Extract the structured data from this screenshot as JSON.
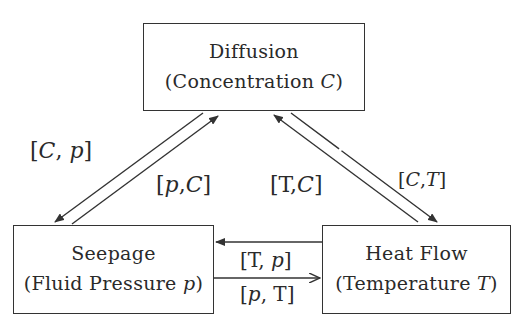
{
  "nodes": {
    "diffusion": {
      "title": "Diffusion",
      "subtitle_prefix": "(Concentration ",
      "variable": "C",
      "subtitle_suffix": ")"
    },
    "seepage": {
      "title": "Seepage",
      "subtitle_prefix": "(Fluid Pressure ",
      "variable": "p",
      "subtitle_suffix": ")"
    },
    "heat_flow": {
      "title": "Heat Flow",
      "subtitle_prefix": "(Temperature ",
      "variable": "T",
      "subtitle_suffix": ")"
    }
  },
  "edges": [
    {
      "from": "diffusion",
      "to": "seepage",
      "label": "[C, p]"
    },
    {
      "from": "seepage",
      "to": "diffusion",
      "label": "[p, C]"
    },
    {
      "from": "heat_flow",
      "to": "diffusion",
      "label": "[T, C]"
    },
    {
      "from": "diffusion",
      "to": "heat_flow",
      "label": "[C, T]"
    },
    {
      "from": "heat_flow",
      "to": "seepage",
      "label": "[T, p]"
    },
    {
      "from": "seepage",
      "to": "heat_flow",
      "label": "[p, T]"
    }
  ],
  "labels": {
    "cp": {
      "open": "[",
      "a": "C",
      "sep": ", ",
      "b": "p",
      "close": "]"
    },
    "pc": {
      "open": "[",
      "a": "p",
      "sep": ",",
      "b": "C",
      "close": "]"
    },
    "tc": {
      "open": "[",
      "a": "T",
      "sep": ",",
      "b": "C",
      "close": "]"
    },
    "ct": {
      "open": "[",
      "a": "C",
      "sep": ",",
      "b": "T",
      "close": "]"
    },
    "tp": {
      "open": "[",
      "a": "T",
      "sep": ", ",
      "b": "p",
      "close": "]"
    },
    "pt": {
      "open": "[",
      "a": "p",
      "sep": ", ",
      "b": "T",
      "close": "]"
    }
  },
  "colors": {
    "line": "#333333",
    "text": "#2a2a2a",
    "background": "#ffffff"
  }
}
